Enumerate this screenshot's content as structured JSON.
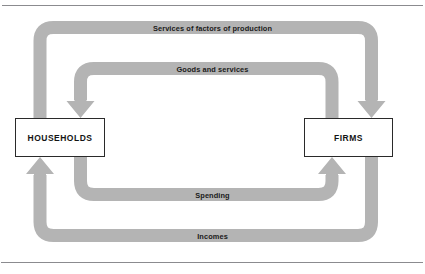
{
  "figure": {
    "background_color": "#ffffff",
    "band_color": "#b4b4b4",
    "rule_color": "#8b8b8f",
    "box_border_color": "#2a2a2a",
    "text_color": "#1a1a1a"
  },
  "entities": {
    "households": {
      "label": "HOUSEHOLDS"
    },
    "firms": {
      "label": "FIRMS"
    }
  },
  "flows": [
    {
      "id": "services-of-factors",
      "label": "Services of factors of production",
      "from": "households",
      "to": "firms",
      "ring": "outer",
      "position": "top",
      "direction": "left-to-right",
      "arrow_at": "firms-top"
    },
    {
      "id": "goods-and-services",
      "label": "Goods and services",
      "from": "firms",
      "to": "households",
      "ring": "inner",
      "position": "upper-middle",
      "direction": "right-to-left",
      "arrow_at": "households-top"
    },
    {
      "id": "spending",
      "label": "Spending",
      "from": "households",
      "to": "firms",
      "ring": "inner",
      "position": "lower-middle",
      "direction": "left-to-right",
      "arrow_at": "firms-bottom"
    },
    {
      "id": "incomes",
      "label": "Incomes",
      "from": "firms",
      "to": "households",
      "ring": "outer",
      "position": "bottom",
      "direction": "right-to-left",
      "arrow_at": "households-bottom"
    }
  ],
  "rules": {
    "top": "horizontal-rule-top",
    "bottom": "horizontal-rule-bottom"
  }
}
